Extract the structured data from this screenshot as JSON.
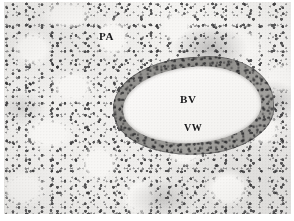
{
  "figure": {
    "kind": "histology-micrograph",
    "staining_tone": "grayscale",
    "background_color": "#ffffff",
    "plate_color": "#f3f2f0",
    "tissue_dark_color": "#28282a",
    "vessel_wall_color": "#8d8c89",
    "vessel_lumen_color": "#f7f6f4",
    "label_color": "#18181a"
  },
  "labels": {
    "pa": "PA",
    "bv": "BV",
    "vw": "VW"
  }
}
